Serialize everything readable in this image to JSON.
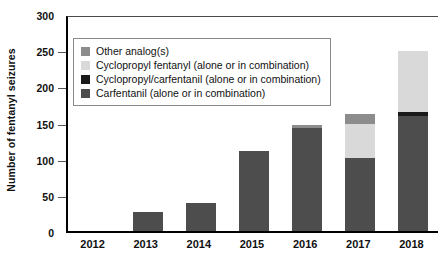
{
  "chart_data": {
    "type": "bar",
    "stacked": true,
    "title": "",
    "xlabel": "",
    "ylabel": "Number of fentanyl seizures",
    "categories": [
      "2012",
      "2013",
      "2014",
      "2015",
      "2016",
      "2017",
      "2018"
    ],
    "ylim": [
      0,
      300
    ],
    "yticks": [
      0,
      50,
      100,
      150,
      200,
      250,
      300
    ],
    "grid": false,
    "legend_position": "upper left inside plot",
    "series": [
      {
        "name": "Carfentanil (alone or in combination)",
        "color": "#4d4d4d",
        "values": [
          0,
          26,
          39,
          111,
          143,
          101,
          159
        ]
      },
      {
        "name": "Cyclopropyl/carfentanil (alone or in combination)",
        "color": "#1a1a1a",
        "values": [
          0,
          0,
          0,
          0,
          0,
          0,
          6
        ]
      },
      {
        "name": "Cyclopropyl fentanyl (alone or in combination)",
        "color": "#d9d9d9",
        "values": [
          0,
          0,
          0,
          0,
          0,
          47,
          84
        ]
      },
      {
        "name": "Other analog(s)",
        "color": "#8c8c8c",
        "values": [
          0,
          0,
          0,
          0,
          3,
          14,
          0
        ]
      }
    ],
    "totals": [
      0,
      26,
      39,
      111,
      146,
      162,
      249
    ]
  },
  "legend": {
    "items": [
      {
        "label": "Other analog(s)",
        "color": "#8c8c8c"
      },
      {
        "label": "Cyclopropyl fentanyl (alone or in combination)",
        "color": "#d9d9d9"
      },
      {
        "label": "Cyclopropyl/carfentanil (alone or in combination)",
        "color": "#1a1a1a"
      },
      {
        "label": "Carfentanil (alone or in combination)",
        "color": "#4d4d4d"
      }
    ]
  }
}
